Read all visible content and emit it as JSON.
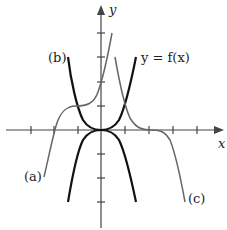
{
  "axes": {
    "x_label": "x",
    "y_label": "y",
    "origin_px": [
      101,
      130
    ],
    "unit_px": 24,
    "x_ticks": [
      -3,
      -2,
      -1,
      1,
      2,
      3,
      4
    ],
    "y_ticks": [
      -3,
      -2,
      -1,
      1,
      2,
      3,
      4
    ]
  },
  "curves": [
    {
      "id": "f",
      "label": "y = f(x)",
      "color": "#111111",
      "width": 2.2
    },
    {
      "id": "b",
      "label": "(b)",
      "color": "#111111",
      "width": 2.2
    },
    {
      "id": "neg",
      "label": "",
      "color": "#111111",
      "width": 2.2
    },
    {
      "id": "a",
      "label": "(a)",
      "color": "#666666",
      "width": 1.5
    },
    {
      "id": "c",
      "label": "(c)",
      "color": "#666666",
      "width": 1.5
    }
  ],
  "labels": {
    "f": "y = f(x)",
    "a": "(a)",
    "b": "(b)",
    "c": "(c)",
    "x": "x",
    "y": "y"
  }
}
